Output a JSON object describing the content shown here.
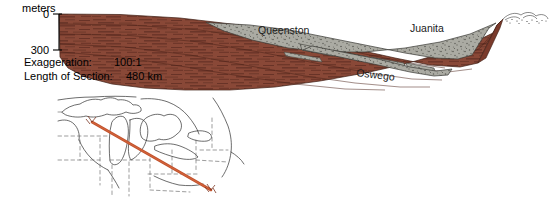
{
  "figure": {
    "type": "geologic-cross-section",
    "axis": {
      "title": "meters",
      "ticks": [
        "0",
        "300"
      ],
      "top_value": "0",
      "bottom_value": "300"
    },
    "annotations": {
      "exaggeration_label": "Exaggeration:",
      "exaggeration_value": "100:1",
      "length_label": "Length of Section:",
      "length_value": "480 km"
    },
    "units": [
      {
        "name": "Queenston",
        "lithology": "gray-stipple",
        "x": 258,
        "y": 31
      },
      {
        "name": "Juanita",
        "lithology": "gray-stipple",
        "x": 411,
        "y": 29
      },
      {
        "name": "Oswego",
        "lithology": "gray-stipple",
        "x": 356,
        "y": 73
      }
    ],
    "colors": {
      "red_bed": "#8B4A38",
      "red_bed_dark": "#6B3426",
      "gray_unit": "#A9A9A1",
      "gray_unit_dark": "#6E6E68",
      "transect_line": "#C0522D",
      "outline": "#1a1a1a"
    }
  },
  "inset_map": {
    "name": "great-lakes-region-map",
    "transect": {
      "label": "section-line",
      "start_marker": "A",
      "end_marker": "A'"
    }
  }
}
